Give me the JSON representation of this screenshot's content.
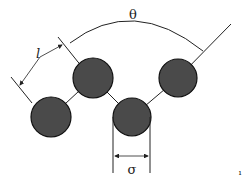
{
  "diagram": {
    "labels": {
      "angle": "θ",
      "bond_length": "l",
      "diameter": "σ",
      "mark": "ı"
    },
    "colors": {
      "bead_fill": "#4a4a4a",
      "bead_stroke": "#111111",
      "line": "#222222",
      "background": "#ffffff"
    },
    "beads": [
      {
        "cx": 51,
        "cy": 117,
        "r": 20
      },
      {
        "cx": 93,
        "cy": 78,
        "r": 20
      },
      {
        "cx": 132,
        "cy": 117,
        "r": 19
      },
      {
        "cx": 178,
        "cy": 78,
        "r": 19
      }
    ]
  }
}
